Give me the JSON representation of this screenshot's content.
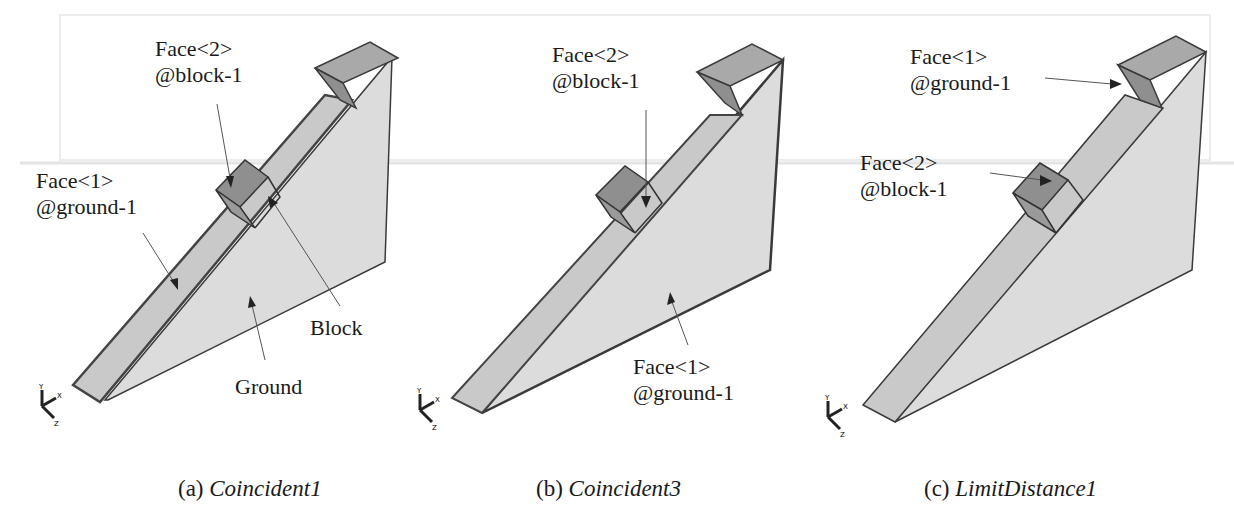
{
  "figure": {
    "panels": [
      {
        "id": "a",
        "caption_prefix": "(a)",
        "caption_name": "Coincident1",
        "labels": {
          "face2_line1": "Face<2>",
          "face2_line2": "@block-1",
          "face1_line1": "Face<1>",
          "face1_line2": "@ground-1",
          "block": "Block",
          "ground": "Ground"
        }
      },
      {
        "id": "b",
        "caption_prefix": "(b)",
        "caption_name": "Coincident3",
        "labels": {
          "face2_line1": "Face<2>",
          "face2_line2": "@block-1",
          "face1_line1": "Face<1>",
          "face1_line2": "@ground-1"
        }
      },
      {
        "id": "c",
        "caption_prefix": "(c)",
        "caption_name": "LimitDistance1",
        "labels": {
          "face1_line1": "Face<1>",
          "face1_line2": "@ground-1",
          "face2_line1": "Face<2>",
          "face2_line2": "@block-1"
        }
      }
    ],
    "triad_axes": [
      "Y",
      "X",
      "Z"
    ],
    "colors": {
      "ramp_face": "#c9c9c9",
      "ground_face": "#dcdcdc",
      "top_face": "#a9a9a9",
      "block_face": "#8f8f8f",
      "edge": "#3a3a3a",
      "highlight_edge": "#555555"
    }
  }
}
